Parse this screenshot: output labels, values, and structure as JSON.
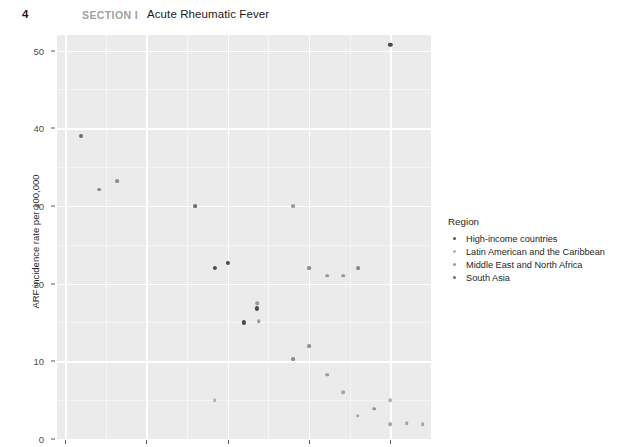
{
  "header": {
    "page_number": "4",
    "section_label": "SECTION I",
    "chapter_title": "Acute Rheumatic Fever"
  },
  "legend": {
    "title": "Region",
    "items": [
      {
        "label": "High-income countries",
        "color": "#5a5a5a"
      },
      {
        "label": "Latin American and the Caribbean",
        "color": "#b4b4b4"
      },
      {
        "label": "Middle East and North Africa",
        "color": "#9a9a9a"
      },
      {
        "label": "South Asia",
        "color": "#6f6f6f"
      }
    ]
  },
  "chart_data": {
    "type": "scatter",
    "title": "",
    "xlabel": "Year of study",
    "ylabel": "ARF incidence rate per 100,000",
    "xlim": [
      1969.5,
      1992.5
    ],
    "ylim": [
      0,
      52
    ],
    "xticks": [
      1970,
      1975,
      1980,
      1985,
      1990
    ],
    "yticks": [
      0,
      10,
      20,
      30,
      40,
      50
    ],
    "xticklabels": [
      "1970",
      "1975",
      "1980",
      "1985",
      "1990"
    ],
    "yticklabels": [
      "0",
      "10",
      "20",
      "30",
      "40",
      "50"
    ],
    "x_minor_ticks": [
      1972.5,
      1977.5,
      1982.5,
      1987.5,
      1992.5
    ],
    "y_minor_ticks": [
      5,
      15,
      25,
      35,
      45
    ],
    "grid": true,
    "panel_background": "#ebebeb",
    "gridline_color": "#ffffff",
    "legend_position": "right",
    "series": [
      {
        "name": "High-income countries",
        "color": "#5a5a5a",
        "points": [
          {
            "x": 1971.0,
            "y": 39.0
          },
          {
            "x": 1972.1,
            "y": 32.1
          },
          {
            "x": 1973.2,
            "y": 33.2
          },
          {
            "x": 1978.0,
            "y": 30.0
          },
          {
            "x": 1979.2,
            "y": 22.0
          },
          {
            "x": 1980.0,
            "y": 22.7
          },
          {
            "x": 1981.0,
            "y": 15.0
          },
          {
            "x": 1981.9,
            "y": 15.2
          },
          {
            "x": 1981.8,
            "y": 17.5
          },
          {
            "x": 1981.8,
            "y": 16.8
          },
          {
            "x": 1984.0,
            "y": 30.0
          },
          {
            "x": 1985.0,
            "y": 22.0
          },
          {
            "x": 1986.1,
            "y": 21.0
          },
          {
            "x": 1987.1,
            "y": 21.0
          },
          {
            "x": 1988.0,
            "y": 22.0
          },
          {
            "x": 1984.0,
            "y": 10.3
          },
          {
            "x": 1985.0,
            "y": 12.0
          },
          {
            "x": 1986.1,
            "y": 8.3
          },
          {
            "x": 1987.1,
            "y": 6.0
          },
          {
            "x": 1988.0,
            "y": 3.0
          },
          {
            "x": 1989.0,
            "y": 3.9
          },
          {
            "x": 1990.0,
            "y": 1.9
          },
          {
            "x": 1991.0,
            "y": 2.0
          },
          {
            "x": 1992.0,
            "y": 1.9
          }
        ]
      },
      {
        "name": "Latin American and the Caribbean",
        "color": "#b4b4b4",
        "points": [
          {
            "x": 1979.2,
            "y": 5.0
          },
          {
            "x": 1990.0,
            "y": 5.0
          }
        ]
      },
      {
        "name": "Middle East and North Africa",
        "color": "#9a9a9a",
        "points": [
          {
            "x": 1984.0,
            "y": 30.0
          }
        ]
      },
      {
        "name": "South Asia",
        "color": "#6f6f6f",
        "points": [
          {
            "x": 1990.0,
            "y": 50.7
          }
        ]
      }
    ],
    "all_points": [
      {
        "x": 1971.0,
        "y": 39.0,
        "c": "#6a6a6a",
        "r": 2.0
      },
      {
        "x": 1972.1,
        "y": 32.1,
        "c": "#8d8d8d",
        "r": 1.9
      },
      {
        "x": 1973.2,
        "y": 33.2,
        "c": "#8d8d8d",
        "r": 1.9
      },
      {
        "x": 1978.0,
        "y": 30.0,
        "c": "#6d6d6d",
        "r": 1.9
      },
      {
        "x": 1979.2,
        "y": 22.0,
        "c": "#4f4f4f",
        "r": 2.1
      },
      {
        "x": 1980.0,
        "y": 22.7,
        "c": "#4a4a4a",
        "r": 2.1
      },
      {
        "x": 1981.0,
        "y": 15.0,
        "c": "#4a4a4a",
        "r": 2.1
      },
      {
        "x": 1981.9,
        "y": 15.2,
        "c": "#9a9a9a",
        "r": 1.8
      },
      {
        "x": 1981.8,
        "y": 17.5,
        "c": "#9a9a9a",
        "r": 1.8
      },
      {
        "x": 1981.8,
        "y": 16.8,
        "c": "#4a4a4a",
        "r": 2.1
      },
      {
        "x": 1984.0,
        "y": 30.0,
        "c": "#9a9a9a",
        "r": 1.9
      },
      {
        "x": 1985.0,
        "y": 22.0,
        "c": "#8a8a8a",
        "r": 1.9
      },
      {
        "x": 1986.1,
        "y": 21.0,
        "c": "#9a9a9a",
        "r": 1.8
      },
      {
        "x": 1987.1,
        "y": 21.0,
        "c": "#9a9a9a",
        "r": 1.8
      },
      {
        "x": 1988.0,
        "y": 22.0,
        "c": "#8a8a8a",
        "r": 1.9
      },
      {
        "x": 1984.0,
        "y": 10.3,
        "c": "#8d8d8d",
        "r": 1.9
      },
      {
        "x": 1985.0,
        "y": 12.0,
        "c": "#8d8d8d",
        "r": 1.9
      },
      {
        "x": 1986.1,
        "y": 8.3,
        "c": "#9a9a9a",
        "r": 1.8
      },
      {
        "x": 1987.1,
        "y": 6.0,
        "c": "#a5a5a5",
        "r": 1.8
      },
      {
        "x": 1988.0,
        "y": 3.0,
        "c": "#a5a5a5",
        "r": 1.8
      },
      {
        "x": 1989.0,
        "y": 3.9,
        "c": "#9a9a9a",
        "r": 1.8
      },
      {
        "x": 1990.0,
        "y": 1.9,
        "c": "#a5a5a5",
        "r": 1.8
      },
      {
        "x": 1991.0,
        "y": 2.0,
        "c": "#a5a5a5",
        "r": 1.8
      },
      {
        "x": 1992.0,
        "y": 1.9,
        "c": "#a5a5a5",
        "r": 1.8
      },
      {
        "x": 1979.2,
        "y": 5.0,
        "c": "#b4b4b4",
        "r": 1.8
      },
      {
        "x": 1990.0,
        "y": 5.0,
        "c": "#b4b4b4",
        "r": 1.8
      },
      {
        "x": 1990.0,
        "y": 50.7,
        "c": "#4a4a4a",
        "r": 2.2
      }
    ]
  }
}
